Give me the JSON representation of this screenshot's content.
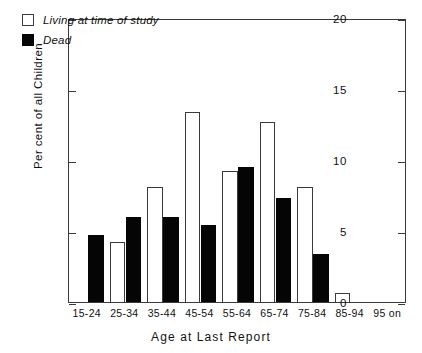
{
  "chart_data": {
    "type": "bar",
    "title": "",
    "xlabel": "Age at Last Report",
    "ylabel": "Per cent of all Children",
    "categories": [
      "15-24",
      "25-34",
      "35-44",
      "45-54",
      "55-64",
      "65-74",
      "75-84",
      "85-94",
      "95 on"
    ],
    "series": [
      {
        "name": "Living at time of study",
        "color": "#ffffff",
        "values": [
          0,
          4.2,
          8.1,
          13.4,
          9.2,
          12.7,
          8.1,
          0.6,
          0
        ]
      },
      {
        "name": "Dead",
        "color": "#050505",
        "values": [
          4.7,
          6.0,
          6.0,
          5.4,
          9.5,
          7.3,
          3.4,
          0,
          0
        ]
      }
    ],
    "ylim": [
      0,
      20
    ],
    "yticks": [
      0,
      5,
      10,
      15,
      20
    ],
    "ytick_labels": [
      "0",
      "5",
      "10",
      "15",
      "20"
    ],
    "grid": false,
    "legend_position": "top-left"
  },
  "legend": {
    "items": [
      {
        "label": "Living at time of study",
        "swatch": "open-square"
      },
      {
        "label": "Dead",
        "swatch": "filled-square"
      }
    ]
  }
}
